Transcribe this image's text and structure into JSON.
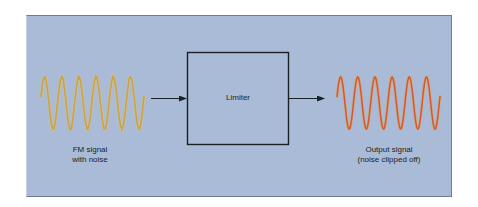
{
  "diagram": {
    "type": "block-diagram",
    "background_color": "#a9bbd6",
    "nodes": [
      {
        "id": "input",
        "kind": "waveform",
        "label_lines": [
          "FM signal",
          "with noise"
        ],
        "cycles": 6,
        "color": "#c9a24a",
        "noisy": true
      },
      {
        "id": "limiter",
        "kind": "box",
        "label": "Limiter"
      },
      {
        "id": "output",
        "kind": "waveform",
        "label_lines": [
          "Output signal",
          "(noise clipped off)"
        ],
        "cycles": 6,
        "color": "#d9572b",
        "noisy": false
      }
    ],
    "edges": [
      {
        "from": "input",
        "to": "limiter",
        "icon": "arrow-right-icon"
      },
      {
        "from": "limiter",
        "to": "output",
        "icon": "arrow-right-icon"
      }
    ]
  },
  "labels": {
    "input_line1": "FM signal",
    "input_line2": "with noise",
    "block": "Limiter",
    "output_line1": "Output signal",
    "output_line2": "(noise clipped off)"
  },
  "colors": {
    "input_wave": "#c9a24a",
    "output_wave": "#d9572b",
    "stroke": "#1c1f24"
  }
}
